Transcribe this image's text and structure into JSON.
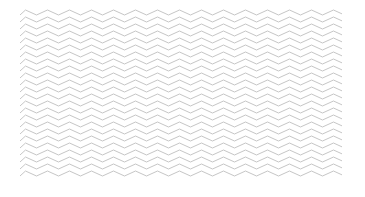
{
  "pattern": {
    "type": "zigzag",
    "stroke_color": "#c6c6c6",
    "background_color": "#ffffff",
    "period_px": 22,
    "amplitude_px": 5,
    "row_spacing_px": 7,
    "rows": 24
  }
}
